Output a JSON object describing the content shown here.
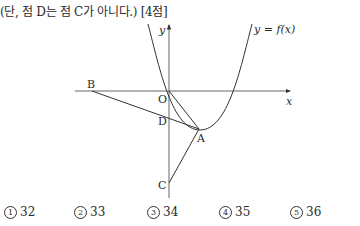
{
  "problem": {
    "note": "(단, 점 D는 점 C가 아니다.) [4점]"
  },
  "figure": {
    "curve_label": "y = f(x)",
    "axis_x_label": "x",
    "axis_y_label": "y",
    "points": {
      "O": "O",
      "A": "A",
      "B": "B",
      "C": "C",
      "D": "D"
    }
  },
  "choices": [
    {
      "num": "1",
      "value": "32"
    },
    {
      "num": "2",
      "value": "33"
    },
    {
      "num": "3",
      "value": "34"
    },
    {
      "num": "4",
      "value": "35"
    },
    {
      "num": "5",
      "value": "36"
    }
  ]
}
